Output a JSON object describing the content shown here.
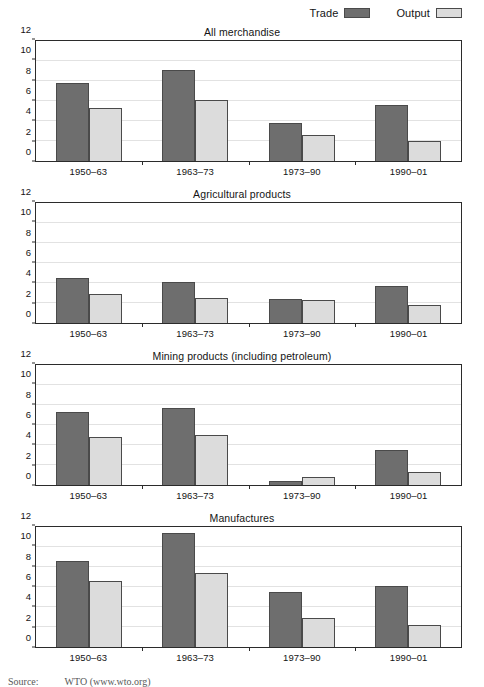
{
  "legend": {
    "position": "top-right",
    "entries": [
      {
        "label": "Trade",
        "color": "#6e6e6e",
        "swatch_name": "trade-swatch"
      },
      {
        "label": "Output",
        "color": "#dcdcdc",
        "swatch_name": "output-swatch"
      }
    ]
  },
  "source_note": {
    "label": "Source:",
    "text": "WTO (www.wto.org)"
  },
  "axis": {
    "yticks": [
      0,
      2,
      4,
      6,
      8,
      10,
      12
    ],
    "ymin": 0,
    "ymax": 12,
    "grid": true
  },
  "categories": [
    "1950–63",
    "1963–73",
    "1973–90",
    "1990–01"
  ],
  "chart_data": [
    {
      "type": "bar",
      "title": "All merchandise",
      "xlabel": "",
      "ylabel": "",
      "ylim": [
        0,
        12
      ],
      "yticks": [
        0,
        2,
        4,
        6,
        8,
        10,
        12
      ],
      "grid": true,
      "legend_position": "top-right",
      "categories": [
        "1950–63",
        "1963–73",
        "1973–90",
        "1990–01"
      ],
      "series": [
        {
          "name": "Trade",
          "color": "#6e6e6e",
          "values": [
            7.8,
            9.1,
            3.8,
            5.65
          ]
        },
        {
          "name": "Output",
          "color": "#dcdcdc",
          "values": [
            5.3,
            6.1,
            2.6,
            2.05
          ]
        }
      ]
    },
    {
      "type": "bar",
      "title": "Agricultural products",
      "xlabel": "",
      "ylabel": "",
      "ylim": [
        0,
        12
      ],
      "yticks": [
        0,
        2,
        4,
        6,
        8,
        10,
        12
      ],
      "grid": true,
      "legend_position": "top-right",
      "categories": [
        "1950–63",
        "1963–73",
        "1973–90",
        "1990–01"
      ],
      "series": [
        {
          "name": "Trade",
          "color": "#6e6e6e",
          "values": [
            4.5,
            4.1,
            2.4,
            3.7
          ]
        },
        {
          "name": "Output",
          "color": "#dcdcdc",
          "values": [
            2.9,
            2.5,
            2.3,
            1.85
          ]
        }
      ]
    },
    {
      "type": "bar",
      "title": "Mining products (including petroleum)",
      "xlabel": "",
      "ylabel": "",
      "ylim": [
        0,
        12
      ],
      "yticks": [
        0,
        2,
        4,
        6,
        8,
        10,
        12
      ],
      "grid": true,
      "legend_position": "top-right",
      "categories": [
        "1950–63",
        "1963–73",
        "1973–90",
        "1990–01"
      ],
      "series": [
        {
          "name": "Trade",
          "color": "#6e6e6e",
          "values": [
            7.35,
            7.75,
            0.45,
            3.5
          ]
        },
        {
          "name": "Output",
          "color": "#dcdcdc",
          "values": [
            4.85,
            5.05,
            0.8,
            1.35
          ]
        }
      ]
    },
    {
      "type": "bar",
      "title": "Manufactures",
      "xlabel": "",
      "ylabel": "",
      "ylim": [
        0,
        12
      ],
      "yticks": [
        0,
        2,
        4,
        6,
        8,
        10,
        12
      ],
      "grid": true,
      "legend_position": "top-right",
      "categories": [
        "1950–63",
        "1963–73",
        "1973–90",
        "1990–01"
      ],
      "series": [
        {
          "name": "Trade",
          "color": "#6e6e6e",
          "values": [
            8.6,
            11.4,
            5.5,
            6.1
          ]
        },
        {
          "name": "Output",
          "color": "#dcdcdc",
          "values": [
            6.65,
            7.4,
            2.95,
            2.2
          ]
        }
      ]
    }
  ]
}
